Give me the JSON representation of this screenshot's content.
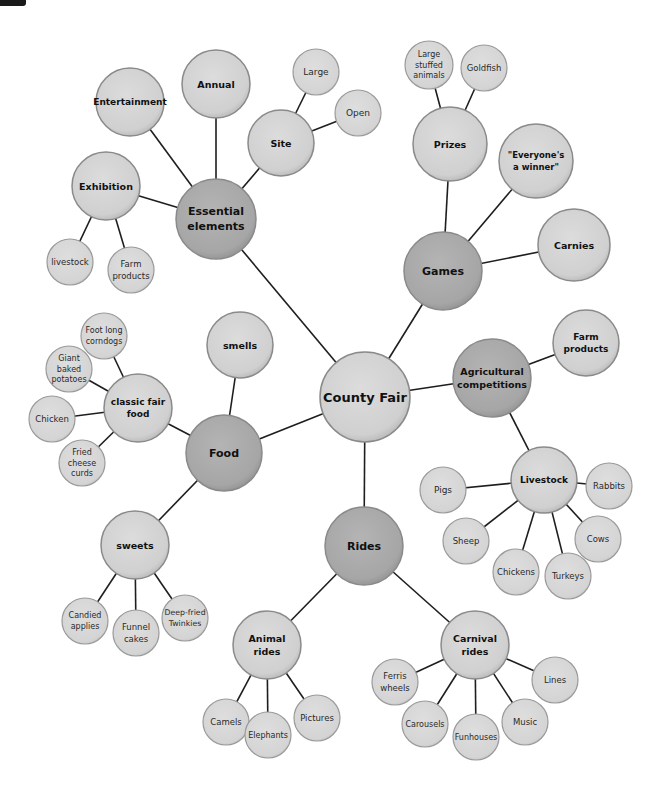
{
  "diagram": {
    "type": "concept-map",
    "colors": {
      "background": "#ffffff",
      "root_fill": "#d2d2d2",
      "category_fill": "#a9a9a9",
      "subtopic_fill": "#d2d2d2",
      "leaf_fill": "#d6d6d6",
      "edge": "#1e1e1e",
      "node_border": "#8a8a8a"
    },
    "nodes": [
      {
        "id": "county_fair",
        "label": [
          "County Fair"
        ],
        "x": 365,
        "y": 397,
        "r": 45,
        "level": "secondary",
        "fs": 13
      },
      {
        "id": "essential",
        "label": [
          "Essential",
          "elements"
        ],
        "x": 216,
        "y": 219,
        "r": 40,
        "level": "primary",
        "fs": 11
      },
      {
        "id": "entertainment",
        "label": [
          "Entertainment"
        ],
        "x": 130,
        "y": 102,
        "r": 34,
        "level": "secondary",
        "fs": 9
      },
      {
        "id": "annual",
        "label": [
          "Annual"
        ],
        "x": 216,
        "y": 84,
        "r": 34,
        "level": "secondary",
        "fs": 9.5
      },
      {
        "id": "site",
        "label": [
          "Site"
        ],
        "x": 281,
        "y": 143,
        "r": 33,
        "level": "secondary",
        "fs": 9.5
      },
      {
        "id": "large",
        "label": [
          "Large"
        ],
        "x": 316,
        "y": 72,
        "r": 23,
        "level": "leaf",
        "fs": 9
      },
      {
        "id": "open",
        "label": [
          "Open"
        ],
        "x": 358,
        "y": 113,
        "r": 23,
        "level": "leaf",
        "fs": 9
      },
      {
        "id": "exhibition",
        "label": [
          "Exhibition"
        ],
        "x": 106,
        "y": 186,
        "r": 34,
        "level": "secondary",
        "fs": 9.5
      },
      {
        "id": "ex_livestock",
        "label": [
          "livestock"
        ],
        "x": 70,
        "y": 262,
        "r": 23,
        "level": "leaf",
        "fs": 8.5
      },
      {
        "id": "ex_farm",
        "label": [
          "Farm",
          "products"
        ],
        "x": 131,
        "y": 270,
        "r": 23,
        "level": "leaf",
        "fs": 8.5
      },
      {
        "id": "games",
        "label": [
          "Games"
        ],
        "x": 443,
        "y": 271,
        "r": 39,
        "level": "primary",
        "fs": 11
      },
      {
        "id": "prizes",
        "label": [
          "Prizes"
        ],
        "x": 450,
        "y": 144,
        "r": 37,
        "level": "secondary",
        "fs": 9.5
      },
      {
        "id": "stuffed",
        "label": [
          "Large",
          "stuffed",
          "animals"
        ],
        "x": 429,
        "y": 65,
        "r": 24,
        "level": "leaf",
        "fs": 8
      },
      {
        "id": "goldfish",
        "label": [
          "Goldfish"
        ],
        "x": 484,
        "y": 68,
        "r": 23,
        "level": "leaf",
        "fs": 8.5
      },
      {
        "id": "winner",
        "label": [
          "\"Everyone's",
          "a winner\""
        ],
        "x": 536,
        "y": 161,
        "r": 37,
        "level": "secondary",
        "fs": 8.5
      },
      {
        "id": "carnies",
        "label": [
          "Carnies"
        ],
        "x": 574,
        "y": 245,
        "r": 36,
        "level": "secondary",
        "fs": 9.5
      },
      {
        "id": "agri",
        "label": [
          "Agricultural",
          "competitions"
        ],
        "x": 492,
        "y": 378,
        "r": 39,
        "level": "primary",
        "fs": 9.5
      },
      {
        "id": "agri_farm",
        "label": [
          "Farm",
          "products"
        ],
        "x": 586,
        "y": 343,
        "r": 33,
        "level": "secondary",
        "fs": 9
      },
      {
        "id": "livestock",
        "label": [
          "Livestock"
        ],
        "x": 544,
        "y": 480,
        "r": 33,
        "level": "secondary",
        "fs": 9
      },
      {
        "id": "pigs",
        "label": [
          "Pigs"
        ],
        "x": 443,
        "y": 490,
        "r": 23,
        "level": "leaf",
        "fs": 9
      },
      {
        "id": "rabbits",
        "label": [
          "Rabbits"
        ],
        "x": 609,
        "y": 486,
        "r": 23,
        "level": "leaf",
        "fs": 8.5
      },
      {
        "id": "sheep",
        "label": [
          "Sheep"
        ],
        "x": 466,
        "y": 541,
        "r": 23,
        "level": "leaf",
        "fs": 8.5
      },
      {
        "id": "chickens",
        "label": [
          "Chickens"
        ],
        "x": 516,
        "y": 572,
        "r": 23,
        "level": "leaf",
        "fs": 8.5
      },
      {
        "id": "turkeys",
        "label": [
          "Turkeys"
        ],
        "x": 568,
        "y": 576,
        "r": 23,
        "level": "leaf",
        "fs": 8.5
      },
      {
        "id": "cows",
        "label": [
          "Cows"
        ],
        "x": 598,
        "y": 539,
        "r": 23,
        "level": "leaf",
        "fs": 8.5
      },
      {
        "id": "food",
        "label": [
          "Food"
        ],
        "x": 224,
        "y": 453,
        "r": 38,
        "level": "primary",
        "fs": 11
      },
      {
        "id": "smells",
        "label": [
          "smells"
        ],
        "x": 240,
        "y": 345,
        "r": 33,
        "level": "secondary",
        "fs": 9.5
      },
      {
        "id": "classic",
        "label": [
          "classic fair",
          "food"
        ],
        "x": 138,
        "y": 408,
        "r": 34,
        "level": "secondary",
        "fs": 9
      },
      {
        "id": "corndogs",
        "label": [
          "Foot long",
          "corndogs"
        ],
        "x": 104,
        "y": 336,
        "r": 23,
        "level": "leaf",
        "fs": 8
      },
      {
        "id": "potatoes",
        "label": [
          "Giant",
          "baked",
          "potatoes"
        ],
        "x": 69,
        "y": 369,
        "r": 23,
        "level": "leaf",
        "fs": 8
      },
      {
        "id": "chicken",
        "label": [
          "Chicken"
        ],
        "x": 52,
        "y": 419,
        "r": 23,
        "level": "leaf",
        "fs": 8.5
      },
      {
        "id": "curds",
        "label": [
          "Fried",
          "cheese",
          "curds"
        ],
        "x": 82,
        "y": 463,
        "r": 23,
        "level": "leaf",
        "fs": 8
      },
      {
        "id": "sweets",
        "label": [
          "sweets"
        ],
        "x": 135,
        "y": 545,
        "r": 34,
        "level": "secondary",
        "fs": 9.5
      },
      {
        "id": "candied",
        "label": [
          "Candied",
          "applies"
        ],
        "x": 85,
        "y": 621,
        "r": 23,
        "level": "leaf",
        "fs": 8
      },
      {
        "id": "funnel",
        "label": [
          "Funnel",
          "cakes"
        ],
        "x": 136,
        "y": 633,
        "r": 23,
        "level": "leaf",
        "fs": 8.5
      },
      {
        "id": "twinkies",
        "label": [
          "Deep-fried",
          "Twinkies"
        ],
        "x": 185,
        "y": 618,
        "r": 23,
        "level": "leaf",
        "fs": 7.8
      },
      {
        "id": "rides",
        "label": [
          "Rides"
        ],
        "x": 364,
        "y": 546,
        "r": 39,
        "level": "primary",
        "fs": 11
      },
      {
        "id": "animal_rides",
        "label": [
          "Animal",
          "rides"
        ],
        "x": 267,
        "y": 645,
        "r": 34,
        "level": "secondary",
        "fs": 9.5
      },
      {
        "id": "camels",
        "label": [
          "Camels"
        ],
        "x": 226,
        "y": 722,
        "r": 23,
        "level": "leaf",
        "fs": 8.5
      },
      {
        "id": "elephants",
        "label": [
          "Elephants"
        ],
        "x": 268,
        "y": 735,
        "r": 23,
        "level": "leaf",
        "fs": 8
      },
      {
        "id": "pictures",
        "label": [
          "Pictures"
        ],
        "x": 317,
        "y": 718,
        "r": 23,
        "level": "leaf",
        "fs": 8.5
      },
      {
        "id": "carnival",
        "label": [
          "Carnival",
          "rides"
        ],
        "x": 475,
        "y": 645,
        "r": 34,
        "level": "secondary",
        "fs": 9.5
      },
      {
        "id": "ferris",
        "label": [
          "Ferris",
          "wheels"
        ],
        "x": 395,
        "y": 682,
        "r": 23,
        "level": "leaf",
        "fs": 8.5
      },
      {
        "id": "carousels",
        "label": [
          "Carousels"
        ],
        "x": 425,
        "y": 724,
        "r": 23,
        "level": "leaf",
        "fs": 8
      },
      {
        "id": "funhouses",
        "label": [
          "Funhouses"
        ],
        "x": 476,
        "y": 737,
        "r": 23,
        "level": "leaf",
        "fs": 8
      },
      {
        "id": "music",
        "label": [
          "Music"
        ],
        "x": 525,
        "y": 722,
        "r": 23,
        "level": "leaf",
        "fs": 8.5
      },
      {
        "id": "lines",
        "label": [
          "Lines"
        ],
        "x": 555,
        "y": 680,
        "r": 23,
        "level": "leaf",
        "fs": 8.5
      }
    ],
    "edges": [
      [
        "county_fair",
        "essential"
      ],
      [
        "county_fair",
        "games"
      ],
      [
        "county_fair",
        "agri"
      ],
      [
        "county_fair",
        "food"
      ],
      [
        "county_fair",
        "rides"
      ],
      [
        "essential",
        "entertainment"
      ],
      [
        "essential",
        "annual"
      ],
      [
        "essential",
        "site"
      ],
      [
        "essential",
        "exhibition"
      ],
      [
        "site",
        "large"
      ],
      [
        "site",
        "open"
      ],
      [
        "exhibition",
        "ex_livestock"
      ],
      [
        "exhibition",
        "ex_farm"
      ],
      [
        "games",
        "prizes"
      ],
      [
        "games",
        "winner"
      ],
      [
        "games",
        "carnies"
      ],
      [
        "prizes",
        "stuffed"
      ],
      [
        "prizes",
        "goldfish"
      ],
      [
        "agri",
        "agri_farm"
      ],
      [
        "agri",
        "livestock"
      ],
      [
        "livestock",
        "pigs"
      ],
      [
        "livestock",
        "rabbits"
      ],
      [
        "livestock",
        "sheep"
      ],
      [
        "livestock",
        "chickens"
      ],
      [
        "livestock",
        "turkeys"
      ],
      [
        "livestock",
        "cows"
      ],
      [
        "food",
        "smells"
      ],
      [
        "food",
        "classic"
      ],
      [
        "food",
        "sweets"
      ],
      [
        "classic",
        "corndogs"
      ],
      [
        "classic",
        "potatoes"
      ],
      [
        "classic",
        "chicken"
      ],
      [
        "classic",
        "curds"
      ],
      [
        "sweets",
        "candied"
      ],
      [
        "sweets",
        "funnel"
      ],
      [
        "sweets",
        "twinkies"
      ],
      [
        "rides",
        "animal_rides"
      ],
      [
        "rides",
        "carnival"
      ],
      [
        "animal_rides",
        "camels"
      ],
      [
        "animal_rides",
        "elephants"
      ],
      [
        "animal_rides",
        "pictures"
      ],
      [
        "carnival",
        "ferris"
      ],
      [
        "carnival",
        "carousels"
      ],
      [
        "carnival",
        "funhouses"
      ],
      [
        "carnival",
        "music"
      ],
      [
        "carnival",
        "lines"
      ]
    ]
  }
}
